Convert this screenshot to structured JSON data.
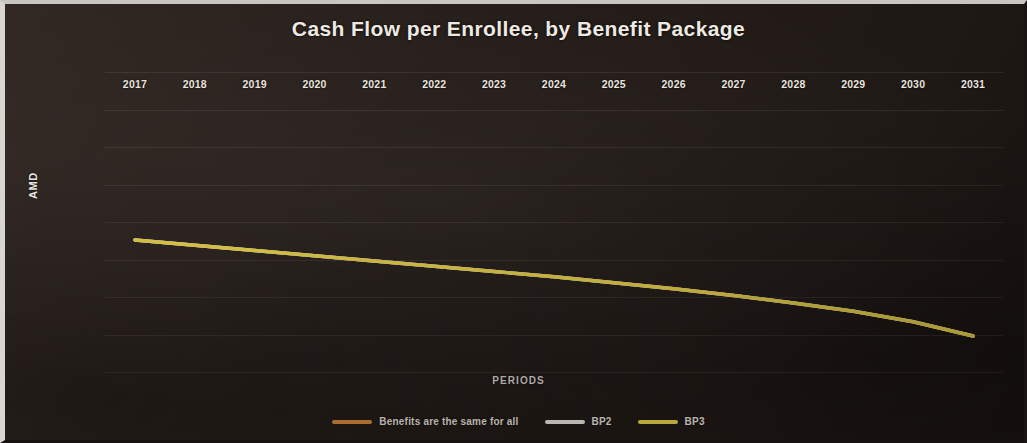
{
  "chart_data": {
    "type": "line",
    "title": "Cash Flow per Enrollee, by Benefit Package",
    "xlabel": "PERIODS",
    "ylabel": "AMD",
    "categories": [
      "2017",
      "2018",
      "2019",
      "2020",
      "2021",
      "2022",
      "2023",
      "2024",
      "2025",
      "2026",
      "2027",
      "2028",
      "2029",
      "2030",
      "2031"
    ],
    "ytick_labels": [
      "0",
      "(5,000)",
      "(10,000)",
      "(15,000)",
      "(20,000)",
      "(25,000)",
      "(30,000)",
      "(35,000)",
      "(40,000)"
    ],
    "ytick_values": [
      0,
      -5000,
      -10000,
      -15000,
      -20000,
      -25000,
      -30000,
      -35000,
      -40000
    ],
    "ylim": [
      -40000,
      0
    ],
    "grid": true,
    "legend_position": "bottom",
    "series": [
      {
        "name": "Benefits are the same for all",
        "color": "#d98a3c",
        "values": [
          -22400,
          -23100,
          -23800,
          -24500,
          -25200,
          -25900,
          -26600,
          -27300,
          -28100,
          -28900,
          -29800,
          -30800,
          -31900,
          -33300,
          -35200
        ]
      },
      {
        "name": "BP2",
        "color": "#e9e6e1",
        "values": [
          -22400,
          -23100,
          -23800,
          -24500,
          -25200,
          -25900,
          -26600,
          -27300,
          -28100,
          -28900,
          -29800,
          -30800,
          -31900,
          -33300,
          -35200
        ]
      },
      {
        "name": "BP3",
        "color": "#e8d24a",
        "values": [
          -22400,
          -23100,
          -23800,
          -24500,
          -25200,
          -25900,
          -26600,
          -27300,
          -28100,
          -28900,
          -29800,
          -30800,
          -31900,
          -33300,
          -35200
        ]
      }
    ]
  },
  "colors": {
    "background": "#241d19",
    "title_text": "#efe9e3",
    "ytick_text": "#c97a5e",
    "xtick_text": "#e9e4df",
    "gridline": "#968778"
  }
}
